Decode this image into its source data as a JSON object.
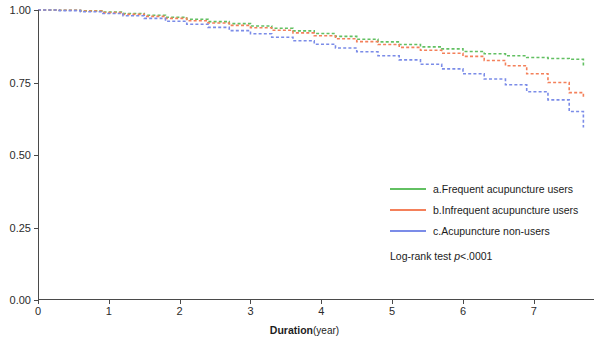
{
  "chart_data": {
    "type": "line",
    "title": "",
    "subtitle": "",
    "xlabel": "Duration",
    "xlabel_unit": "(year)",
    "ylabel": "",
    "xlim": [
      0,
      7.85
    ],
    "ylim": [
      0,
      1.0
    ],
    "x_ticks": [
      0,
      1,
      2,
      3,
      4,
      5,
      6,
      7
    ],
    "x_tick_labels": [
      "0",
      "1",
      "2",
      "3",
      "4",
      "5",
      "6",
      "7"
    ],
    "y_ticks": [
      0.0,
      0.25,
      0.5,
      0.75,
      1.0
    ],
    "y_tick_labels": [
      "0.00",
      "0.25",
      "0.50",
      "0.75",
      "1.00"
    ],
    "grid": false,
    "legend_position": "center-right",
    "annotation": "Log-rank test p<.0001",
    "annotation_prefix": "Log-rank test ",
    "annotation_italic": "p",
    "annotation_suffix": "<.0001",
    "series": [
      {
        "name": "a.Frequent acupuncture users",
        "color": "#62c062",
        "x": [
          0,
          0.3,
          0.6,
          0.9,
          1.2,
          1.5,
          1.8,
          2.1,
          2.4,
          2.7,
          3.0,
          3.3,
          3.6,
          3.9,
          4.2,
          4.5,
          4.8,
          5.1,
          5.4,
          5.7,
          6.0,
          6.3,
          6.6,
          6.9,
          7.2,
          7.5,
          7.7
        ],
        "values": [
          1.0,
          0.999,
          0.997,
          0.993,
          0.988,
          0.982,
          0.975,
          0.968,
          0.96,
          0.953,
          0.945,
          0.937,
          0.928,
          0.919,
          0.909,
          0.899,
          0.89,
          0.881,
          0.873,
          0.866,
          0.857,
          0.849,
          0.842,
          0.836,
          0.833,
          0.83,
          0.805
        ]
      },
      {
        "name": "b.Infrequent acupuncture users",
        "color": "#f4805a",
        "x": [
          0,
          0.3,
          0.6,
          0.9,
          1.2,
          1.5,
          1.8,
          2.1,
          2.4,
          2.7,
          3.0,
          3.3,
          3.6,
          3.9,
          4.2,
          4.5,
          4.8,
          5.1,
          5.4,
          5.7,
          6.0,
          6.3,
          6.6,
          6.9,
          7.2,
          7.5,
          7.7
        ],
        "values": [
          1.0,
          0.999,
          0.996,
          0.991,
          0.985,
          0.978,
          0.971,
          0.963,
          0.955,
          0.947,
          0.939,
          0.93,
          0.921,
          0.911,
          0.901,
          0.891,
          0.881,
          0.871,
          0.861,
          0.851,
          0.84,
          0.826,
          0.808,
          0.78,
          0.75,
          0.715,
          0.7
        ]
      },
      {
        "name": "c.Acupuncture non-users",
        "color": "#7b8ce8",
        "x": [
          0,
          0.3,
          0.6,
          0.9,
          1.2,
          1.5,
          1.8,
          2.1,
          2.4,
          2.7,
          3.0,
          3.3,
          3.6,
          3.9,
          4.2,
          4.5,
          4.8,
          5.1,
          5.4,
          5.7,
          6.0,
          6.3,
          6.6,
          6.9,
          7.2,
          7.5,
          7.7
        ],
        "values": [
          1.0,
          0.998,
          0.994,
          0.988,
          0.98,
          0.971,
          0.961,
          0.951,
          0.94,
          0.929,
          0.918,
          0.906,
          0.894,
          0.882,
          0.869,
          0.856,
          0.842,
          0.828,
          0.813,
          0.797,
          0.78,
          0.762,
          0.742,
          0.718,
          0.69,
          0.65,
          0.595
        ]
      }
    ]
  },
  "legend": {
    "items": [
      {
        "label": "a.Frequent acupuncture users",
        "color": "#62c062"
      },
      {
        "label": "b.Infrequent acupuncture users",
        "color": "#f4805a"
      },
      {
        "label": "c.Acupuncture non-users",
        "color": "#7b8ce8"
      }
    ]
  }
}
